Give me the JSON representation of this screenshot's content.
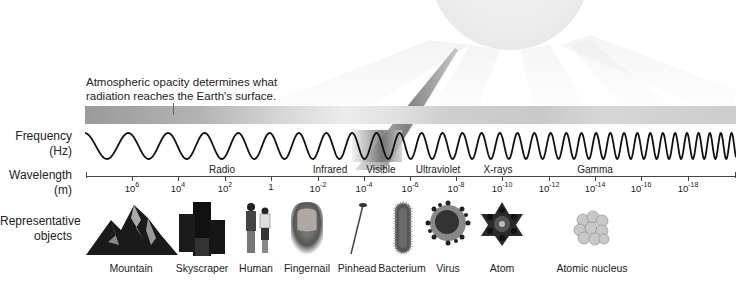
{
  "annotation": {
    "line1": "Atmospheric opacity determines what",
    "line2": "radiation reaches the Earth's surface."
  },
  "row_labels": {
    "frequency": "Frequency",
    "frequency_unit": "(Hz)",
    "wavelength": "Wavelength",
    "wavelength_unit": "(m)",
    "objects": "Representative",
    "objects2": "objects"
  },
  "bands": [
    {
      "label": "Radio",
      "x": 222
    },
    {
      "label": "Infrared",
      "x": 330
    },
    {
      "label": "Visible",
      "x": 381
    },
    {
      "label": "Ultraviolet",
      "x": 438
    },
    {
      "label": "X-rays",
      "x": 498
    },
    {
      "label": "Gamma",
      "x": 595
    }
  ],
  "wavelength_ticks": [
    {
      "base": "10",
      "exp": "6",
      "x": 132
    },
    {
      "base": "10",
      "exp": "4",
      "x": 178
    },
    {
      "base": "10",
      "exp": "2",
      "x": 225
    },
    {
      "base": "1",
      "exp": "",
      "x": 271
    },
    {
      "base": "10",
      "exp": "-2",
      "x": 318
    },
    {
      "base": "10",
      "exp": "-4",
      "x": 364
    },
    {
      "base": "10",
      "exp": "-6",
      "x": 410
    },
    {
      "base": "10",
      "exp": "-8",
      "x": 456
    },
    {
      "base": "10",
      "exp": "-10",
      "x": 502
    },
    {
      "base": "10",
      "exp": "-12",
      "x": 549
    },
    {
      "base": "10",
      "exp": "-14",
      "x": 595
    },
    {
      "base": "10",
      "exp": "-16",
      "x": 641
    },
    {
      "base": "10",
      "exp": "-18",
      "x": 688
    }
  ],
  "objects": [
    {
      "label": "Mountain",
      "x": 131,
      "icon": "mountain-icon"
    },
    {
      "label": "Skyscraper",
      "x": 202,
      "icon": "skyscraper-icon"
    },
    {
      "label": "Human",
      "x": 256,
      "icon": "human-icon"
    },
    {
      "label": "Fingernail",
      "x": 307,
      "icon": "fingernail-icon"
    },
    {
      "label": "Pinhead",
      "x": 357,
      "icon": "pinhead-icon"
    },
    {
      "label": "Bacterium",
      "x": 402,
      "icon": "bacterium-icon"
    },
    {
      "label": "Virus",
      "x": 448,
      "icon": "virus-icon"
    },
    {
      "label": "Atom",
      "x": 502,
      "icon": "atom-icon"
    },
    {
      "label": "Atomic nucleus",
      "x": 592,
      "icon": "atomic-nucleus-icon"
    }
  ],
  "colors": {
    "wave": "#111111",
    "axis": "#444444",
    "atmosphere_dark": "#9a9a9a",
    "atmosphere_light": "#ececec",
    "sun": "#ececec"
  }
}
